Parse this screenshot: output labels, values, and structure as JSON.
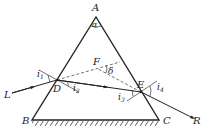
{
  "diagram": {
    "labels": {
      "apex": "A",
      "apex_angle": "α",
      "base_left": "B",
      "base_right": "C",
      "incidence_point": "D",
      "exit_point": "E",
      "intersection": "F",
      "deviation_angle": "δ",
      "incoming_ray": "L",
      "outgoing_ray": "R",
      "i1": "i",
      "i1_sub": "1",
      "i2": "i",
      "i2_sub": "2",
      "i3": "i",
      "i3_sub": "3",
      "i4": "i",
      "i4_sub": "4"
    },
    "line_color": "#222222"
  }
}
